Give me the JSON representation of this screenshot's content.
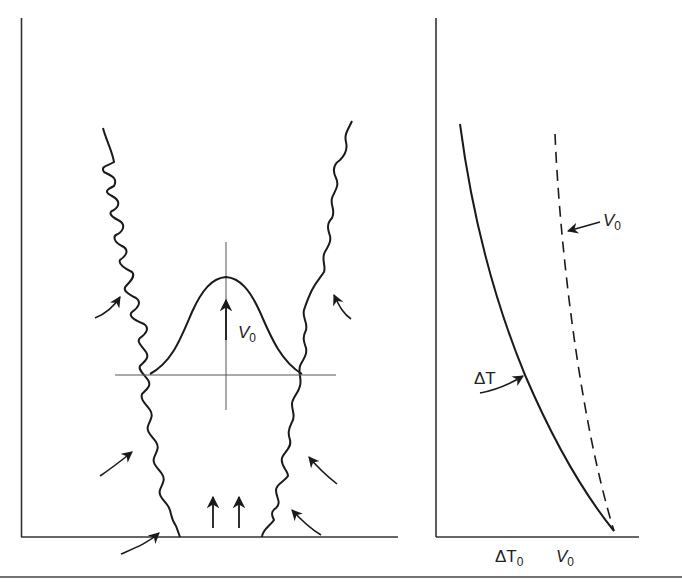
{
  "figure": {
    "colors": {
      "ink": "#1a1a1a",
      "axis": "#333333",
      "guide": "#555555",
      "background": "#ffffff"
    },
    "left_panel": {
      "name": "plume-cross-section",
      "labels": {
        "velocity_profile": "V",
        "velocity_profile_sub": "0"
      },
      "entrainment_arrows": 6,
      "source_arrows": 2
    },
    "right_panel": {
      "name": "profile-plot",
      "curve_labels": {
        "delta_t": "ΔT",
        "v0": "V",
        "v0_sub": "0"
      },
      "x_axis_ticks": [
        {
          "text": "ΔT",
          "sub": "0"
        },
        {
          "text": "V",
          "sub": "0"
        }
      ],
      "series": [
        {
          "name": "ΔT",
          "style": "solid"
        },
        {
          "name": "V0",
          "style": "dashed"
        }
      ]
    }
  }
}
